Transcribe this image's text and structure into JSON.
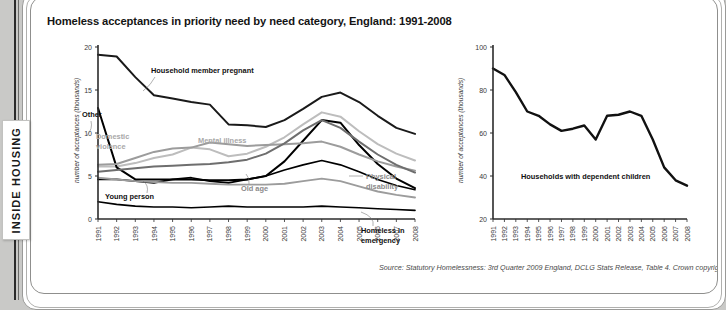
{
  "brand": {
    "name": "INSIDE HOUSING"
  },
  "title": "Homeless acceptances in priority need by need category, England: 1991-2008",
  "source": "Source: Statutory Homelessness: 3rd Quarter 2009 England, DCLG Stats Release, Table 4. Crown copyright.",
  "labels": {
    "household_member_pregnant": "Household member pregnant",
    "other": "Other",
    "domestic_violence_l1": "Domestic",
    "domestic_violence_l2": "violence",
    "mental_illness": "Mental illness",
    "young_person": "Young person",
    "old_age": "Old age",
    "physical_disability_l1": "Physical",
    "physical_disability_l2": "disability",
    "homeless_in_emergency_l1": "Homeless in",
    "homeless_in_emergency_l2": "emergency",
    "dependent_children": "Households with dependent children"
  },
  "colors": {
    "dark": "#1a1a1a",
    "black": "#000000",
    "mid_grey": "#6e6e6e",
    "grey": "#9c9c9c",
    "light_grey": "#bdbdbd",
    "axis": "#2b2b2b",
    "brand_bar": "#2b2b2b"
  },
  "chart_data": [
    {
      "id": "left",
      "type": "line",
      "title": "Homeless acceptances in priority need by need category, England: 1991-2008",
      "xlabel": "",
      "ylabel": "number of acceptances (thousands)",
      "x": [
        1991,
        1992,
        1993,
        1994,
        1995,
        1996,
        1997,
        1998,
        1999,
        2000,
        2001,
        2002,
        2003,
        2004,
        2005,
        2006,
        2007,
        2008
      ],
      "xticklabels": [
        "1991",
        "1992",
        "1993",
        "1994",
        "1995",
        "1996",
        "1997",
        "1998",
        "1999",
        "2000",
        "2001",
        "2002",
        "2003",
        "2004",
        "2005",
        "2006",
        "2007",
        "2008"
      ],
      "yticks": [
        0,
        5,
        10,
        15,
        20
      ],
      "ylim": [
        0,
        20
      ],
      "grid": false,
      "legend": "inline-annotations",
      "series": [
        {
          "name": "Household member pregnant",
          "color": "#1a1a1a",
          "width": 2.0,
          "values": [
            19.1,
            18.9,
            16.5,
            14.4,
            14.0,
            13.6,
            13.3,
            11.0,
            10.9,
            10.7,
            11.5,
            12.8,
            14.2,
            14.7,
            13.6,
            12.0,
            10.6,
            9.9
          ]
        },
        {
          "name": "Mental illness",
          "color": "#bdbdbd",
          "width": 2.0,
          "values": [
            6.1,
            6.1,
            6.5,
            7.1,
            7.5,
            8.3,
            8.1,
            7.3,
            7.6,
            8.4,
            9.5,
            11.0,
            12.4,
            11.9,
            10.2,
            8.7,
            7.6,
            6.8
          ]
        },
        {
          "name": "Other",
          "color": "#000000",
          "width": 2.0,
          "values": [
            12.9,
            6.0,
            4.6,
            4.6,
            4.6,
            4.6,
            4.5,
            4.5,
            4.6,
            5.0,
            6.7,
            9.1,
            11.5,
            11.2,
            8.6,
            6.4,
            4.7,
            3.6
          ]
        },
        {
          "name": "Domestic violence",
          "color": "#9c9c9c",
          "width": 2.0,
          "values": [
            6.3,
            6.4,
            7.1,
            7.8,
            8.2,
            8.3,
            8.9,
            8.7,
            8.5,
            8.6,
            8.7,
            8.8,
            9.0,
            8.4,
            7.5,
            6.7,
            6.1,
            5.6
          ]
        },
        {
          "name": "Physical disability",
          "color": "#6e6e6e",
          "width": 2.0,
          "values": [
            5.5,
            5.7,
            5.9,
            6.1,
            6.2,
            6.3,
            6.4,
            6.6,
            6.9,
            7.6,
            8.8,
            10.3,
            11.5,
            10.6,
            9.0,
            7.5,
            6.3,
            5.4
          ]
        },
        {
          "name": "Young person",
          "color": "#000000",
          "width": 1.7,
          "values": [
            4.6,
            4.6,
            4.4,
            4.2,
            4.6,
            4.8,
            4.4,
            4.2,
            4.6,
            5.0,
            5.7,
            6.3,
            6.8,
            6.3,
            5.5,
            4.6,
            3.9,
            3.4
          ]
        },
        {
          "name": "Old age",
          "color": "#9c9c9c",
          "width": 1.9,
          "values": [
            4.8,
            4.6,
            4.4,
            4.3,
            4.2,
            4.2,
            4.1,
            4.0,
            4.0,
            4.0,
            4.1,
            4.4,
            4.7,
            4.4,
            3.8,
            3.2,
            2.8,
            2.5
          ]
        },
        {
          "name": "Homeless in emergency",
          "color": "#000000",
          "width": 1.6,
          "values": [
            2.0,
            1.7,
            1.5,
            1.4,
            1.4,
            1.3,
            1.4,
            1.5,
            1.4,
            1.4,
            1.4,
            1.4,
            1.5,
            1.4,
            1.3,
            1.2,
            1.1,
            1.0
          ]
        }
      ]
    },
    {
      "id": "right",
      "type": "line",
      "title": "",
      "xlabel": "",
      "ylabel": "number of acceptances (thousands)",
      "x": [
        1991,
        1992,
        1993,
        1994,
        1995,
        1996,
        1997,
        1998,
        1999,
        2000,
        2001,
        2002,
        2003,
        2004,
        2005,
        2006,
        2007,
        2008
      ],
      "xticklabels": [
        "1991",
        "1992",
        "1993",
        "1994",
        "1995",
        "1996",
        "1997",
        "1998",
        "1999",
        "2000",
        "2001",
        "2002",
        "2003",
        "2004",
        "2005",
        "2006",
        "2007",
        "2008"
      ],
      "yticks": [
        20,
        40,
        60,
        80,
        100
      ],
      "ylim": [
        20,
        100
      ],
      "grid": false,
      "series": [
        {
          "name": "Households with dependent children",
          "color": "#111111",
          "width": 2.4,
          "values": [
            90,
            87,
            79,
            70,
            68,
            64,
            61,
            62,
            63.5,
            57,
            68,
            68.5,
            70,
            68,
            57,
            44,
            38,
            35.5
          ]
        }
      ]
    }
  ]
}
